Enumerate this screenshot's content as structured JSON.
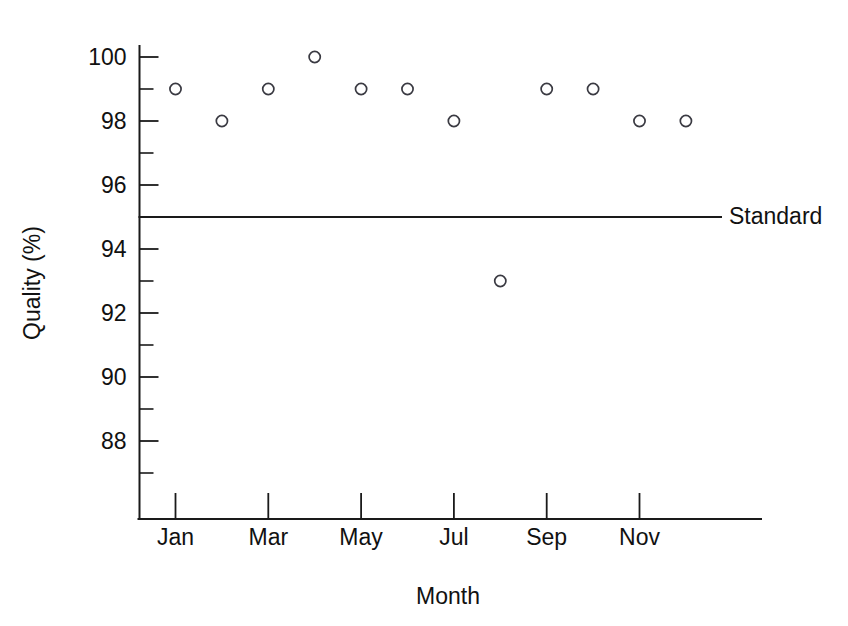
{
  "chart_data": {
    "type": "scatter",
    "title": "",
    "xlabel": "Month",
    "ylabel": "Quality (%)",
    "categories": [
      "Jan",
      "Feb",
      "Mar",
      "Apr",
      "May",
      "Jun",
      "Jul",
      "Aug",
      "Sep",
      "Oct",
      "Nov",
      "Dec"
    ],
    "values": [
      99,
      98,
      99,
      100,
      99,
      99,
      98,
      93,
      99,
      99,
      98,
      98
    ],
    "series": [
      {
        "name": "Quality",
        "marker": "open-circle",
        "values": [
          99,
          98,
          99,
          100,
          99,
          99,
          98,
          93,
          99,
          99,
          98,
          98
        ]
      }
    ],
    "reference_lines": [
      {
        "name": "Standard",
        "label": "Standard",
        "value": 95,
        "orientation": "horizontal"
      }
    ],
    "ylim": [
      86.5,
      100.8
    ],
    "xlim": [
      0.3,
      13.4
    ],
    "y_major_ticks": [
      100,
      98,
      96,
      94,
      92,
      90,
      88
    ],
    "y_minor_ticks": [
      99,
      97,
      95,
      93,
      91,
      89,
      87
    ],
    "y_tick_labels": [
      "100",
      "98",
      "96",
      "94",
      "92",
      "90",
      "88"
    ],
    "x_tick_months": [
      "Jan",
      "Mar",
      "May",
      "Jul",
      "Sep",
      "Nov"
    ],
    "x_tick_labels": [
      "Jan",
      "Mar",
      "May",
      "Jul",
      "Sep",
      "Nov"
    ],
    "grid": false,
    "legend_position": "inline-right",
    "colors": {
      "axis": "#1a1a1a",
      "marker_stroke": "#3a3a42",
      "marker_fill": "#ffffff",
      "reference_line": "#1a1a1a",
      "background": "#ffffff"
    }
  }
}
